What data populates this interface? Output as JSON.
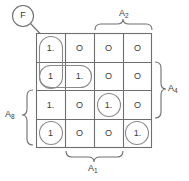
{
  "diagram": {
    "type": "karnaugh-map",
    "function_label": "F",
    "rows": 4,
    "columns": 4,
    "cells": [
      [
        {
          "value": "1.",
          "grouped": true
        },
        {
          "value": "O",
          "grouped": false
        },
        {
          "value": "O",
          "grouped": false
        },
        {
          "value": "O",
          "grouped": false
        }
      ],
      [
        {
          "value": "1",
          "grouped": true
        },
        {
          "value": "1.",
          "grouped": true
        },
        {
          "value": "O",
          "grouped": false
        },
        {
          "value": "O",
          "grouped": false
        }
      ],
      [
        {
          "value": "1.",
          "grouped": false
        },
        {
          "value": "O",
          "grouped": false
        },
        {
          "value": "1.",
          "grouped": true
        },
        {
          "value": "O",
          "grouped": false
        }
      ],
      [
        {
          "value": "1",
          "grouped": true
        },
        {
          "value": "O",
          "grouped": false
        },
        {
          "value": "O",
          "grouped": false
        },
        {
          "value": "1.",
          "grouped": true
        }
      ]
    ],
    "axis_labels": {
      "top": "A",
      "top_sub": "2",
      "right": "A",
      "right_sub": "4",
      "left": "A",
      "left_sub": "8",
      "bottom": "A",
      "bottom_sub": "1"
    },
    "groupings": [
      {
        "name": "col1-rows1-2",
        "shape": "rounded-rect-vertical"
      },
      {
        "name": "row2-cols1-2",
        "shape": "rounded-rect-horizontal"
      },
      {
        "name": "r3c3",
        "shape": "circle"
      },
      {
        "name": "r4c1",
        "shape": "circle"
      },
      {
        "name": "r4c4",
        "shape": "circle"
      }
    ],
    "colors": {
      "stroke": "#6e6e6e",
      "text": "#3a3a3a",
      "background": "#ffffff"
    }
  }
}
